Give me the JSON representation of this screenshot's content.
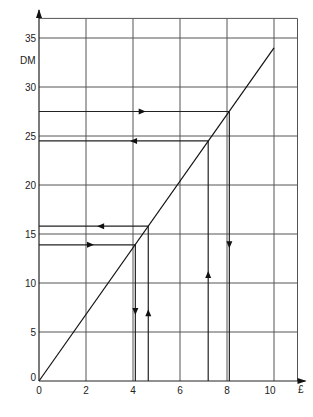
{
  "chart_data": {
    "type": "line",
    "title": "",
    "xlabel": "£",
    "ylabel": "DM",
    "xlim": [
      0,
      11
    ],
    "ylim": [
      0,
      37
    ],
    "grid": true,
    "x_ticks": [
      0,
      2,
      4,
      6,
      8,
      10
    ],
    "y_ticks": [
      0,
      5,
      10,
      15,
      20,
      25,
      30,
      35
    ],
    "x_tick_labels": [
      "0",
      "2",
      "4",
      "6",
      "8",
      "10"
    ],
    "y_tick_labels": [
      "0",
      "5",
      "10",
      "15",
      "20",
      "25",
      "30",
      "35"
    ],
    "series": [
      {
        "name": "Conversion line",
        "x": [
          0,
          10
        ],
        "y": [
          0,
          34
        ]
      }
    ],
    "conversions": [
      {
        "pounds": 4.1,
        "dm": 13.9,
        "direction": "dm_to_pounds"
      },
      {
        "pounds": 4.65,
        "dm": 15.8,
        "direction": "pounds_to_dm"
      },
      {
        "pounds": 7.2,
        "dm": 24.5,
        "direction": "pounds_to_dm"
      },
      {
        "pounds": 8.1,
        "dm": 27.5,
        "direction": "dm_to_pounds"
      }
    ]
  },
  "labels": {
    "x_axis": "£",
    "y_axis": "DM"
  }
}
